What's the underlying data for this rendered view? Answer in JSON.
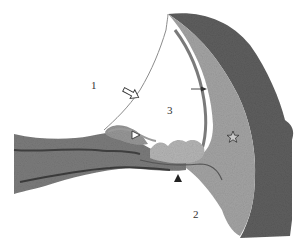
{
  "figure": {
    "labels": [
      {
        "id": "1",
        "text": "1",
        "x": 91,
        "y": 80
      },
      {
        "id": "2",
        "text": "2",
        "x": 193,
        "y": 209
      },
      {
        "id": "3",
        "text": "3",
        "x": 167,
        "y": 105
      }
    ],
    "markers": {
      "open_arrow": "open-arrow",
      "solid_arrow": "solid-arrow",
      "open_arrowhead": "open-arrowhead",
      "filled_arrowhead": "filled-arrowhead",
      "star": "star"
    },
    "colors": {
      "background": "#ffffff",
      "bone": "#5a5a5a",
      "ligament": "#9a9a9a",
      "lamina": "#7a7a7a",
      "membrane": "#8c8c8c"
    }
  }
}
